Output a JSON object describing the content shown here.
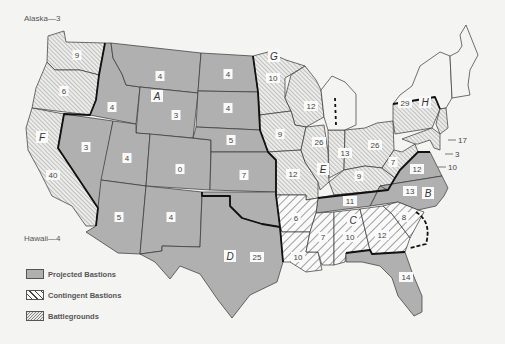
{
  "notes": {
    "alaska": "Alaska—3",
    "hawaii": "Hawaii—4"
  },
  "legend": [
    {
      "key": "projected",
      "label": "Projected Bastions",
      "color": "#b0b0b0"
    },
    {
      "key": "contingent",
      "label": "Contingent Bastions",
      "pattern": "wide-diagonal-hatch"
    },
    {
      "key": "battleground",
      "label": "Battlegrounds",
      "pattern": "fine-diagonal-hatch"
    }
  ],
  "colors": {
    "projected": "#b0b0b0",
    "background": "#f4f4f2",
    "border": "#333333"
  },
  "region_letters": [
    {
      "letter": "A",
      "x": 157,
      "y": 98
    },
    {
      "letter": "B",
      "x": 428,
      "y": 195
    },
    {
      "letter": "C",
      "x": 353,
      "y": 222
    },
    {
      "letter": "D",
      "x": 230,
      "y": 258
    },
    {
      "letter": "E",
      "x": 323,
      "y": 171
    },
    {
      "letter": "F",
      "x": 42,
      "y": 139
    },
    {
      "letter": "G",
      "x": 274,
      "y": 58
    },
    {
      "letter": "H",
      "x": 425,
      "y": 104
    }
  ],
  "states": [
    {
      "name": "Washington",
      "value": "9",
      "cat": "battleground",
      "x": 77,
      "y": 56
    },
    {
      "name": "Oregon",
      "value": "6",
      "cat": "battleground",
      "x": 64,
      "y": 92
    },
    {
      "name": "California",
      "value": "40",
      "cat": "battleground",
      "x": 53,
      "y": 176
    },
    {
      "name": "Idaho",
      "value": "4",
      "cat": "projected",
      "x": 112,
      "y": 108
    },
    {
      "name": "Montana",
      "value": "4",
      "cat": "projected",
      "x": 160,
      "y": 77
    },
    {
      "name": "Nevada",
      "value": "3",
      "cat": "projected",
      "x": 86,
      "y": 148
    },
    {
      "name": "Wyoming",
      "value": "3",
      "cat": "projected",
      "x": 176,
      "y": 116
    },
    {
      "name": "Utah",
      "value": "4",
      "cat": "projected",
      "x": 127,
      "y": 159
    },
    {
      "name": "Colorado",
      "value": "0",
      "cat": "projected",
      "x": 180,
      "y": 170
    },
    {
      "name": "Arizona",
      "value": "5",
      "cat": "projected",
      "x": 119,
      "y": 218
    },
    {
      "name": "New Mexico",
      "value": "4",
      "cat": "projected",
      "x": 171,
      "y": 218
    },
    {
      "name": "North Dakota",
      "value": "4",
      "cat": "projected",
      "x": 228,
      "y": 75
    },
    {
      "name": "South Dakota",
      "value": "4",
      "cat": "projected",
      "x": 228,
      "y": 109
    },
    {
      "name": "Nebraska",
      "value": "5",
      "cat": "projected",
      "x": 231,
      "y": 141
    },
    {
      "name": "Kansas",
      "value": "7",
      "cat": "projected",
      "x": 244,
      "y": 176
    },
    {
      "name": "Oklahoma",
      "value": "",
      "cat": "projected",
      "x": 262,
      "y": 220
    },
    {
      "name": "Texas",
      "value": "25",
      "cat": "projected",
      "x": 257,
      "y": 258
    },
    {
      "name": "Minnesota",
      "value": "10",
      "cat": "battleground",
      "x": 273,
      "y": 79
    },
    {
      "name": "Wisconsin",
      "value": "12",
      "cat": "battleground",
      "x": 311,
      "y": 107
    },
    {
      "name": "Iowa",
      "value": "9",
      "cat": "battleground",
      "x": 280,
      "y": 135
    },
    {
      "name": "Missouri",
      "value": "12",
      "cat": "battleground",
      "x": 293,
      "y": 175
    },
    {
      "name": "Illinois",
      "value": "26",
      "cat": "battleground",
      "x": 319,
      "y": 143
    },
    {
      "name": "Indiana",
      "value": "13",
      "cat": "battleground",
      "x": 345,
      "y": 154
    },
    {
      "name": "Ohio",
      "value": "26",
      "cat": "battleground",
      "x": 375,
      "y": 146
    },
    {
      "name": "Kentucky",
      "value": "9",
      "cat": "battleground",
      "x": 359,
      "y": 177
    },
    {
      "name": "West Virginia",
      "value": "7",
      "cat": "battleground",
      "x": 393,
      "y": 163
    },
    {
      "name": "Pennsylvania",
      "value": "29",
      "cat": "battleground",
      "x": 405,
      "y": 104
    },
    {
      "name": "Virginia",
      "value": "12",
      "cat": "projected",
      "x": 417,
      "y": 170
    },
    {
      "name": "North Carolina",
      "value": "13",
      "cat": "projected",
      "x": 410,
      "y": 192
    },
    {
      "name": "Tennessee",
      "value": "11",
      "cat": "projected",
      "x": 350,
      "y": 202
    },
    {
      "name": "Arkansas",
      "value": "6",
      "cat": "contingent",
      "x": 296,
      "y": 219
    },
    {
      "name": "Louisiana",
      "value": "10",
      "cat": "contingent",
      "x": 298,
      "y": 258
    },
    {
      "name": "Mississippi",
      "value": "7",
      "cat": "contingent",
      "x": 323,
      "y": 238
    },
    {
      "name": "Alabama",
      "value": "10",
      "cat": "contingent",
      "x": 350,
      "y": 238
    },
    {
      "name": "Georgia",
      "value": "12",
      "cat": "contingent",
      "x": 382,
      "y": 236
    },
    {
      "name": "South Carolina",
      "value": "8",
      "cat": "contingent",
      "x": 404,
      "y": 218
    },
    {
      "name": "Florida",
      "value": "14",
      "cat": "projected",
      "x": 406,
      "y": 278
    }
  ],
  "callouts": [
    {
      "value": "17",
      "x": 458,
      "y": 143
    },
    {
      "value": "3",
      "x": 455,
      "y": 157
    },
    {
      "value": "10",
      "x": 448,
      "y": 170
    }
  ]
}
